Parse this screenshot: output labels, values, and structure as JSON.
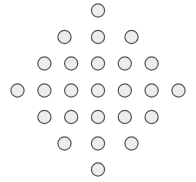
{
  "figure": {
    "name": "diamond-circle-lattice",
    "width": 196,
    "height": 182,
    "background_color": "#ffffff"
  },
  "style": {
    "node_fill": "#ededed",
    "node_stroke": "#555555",
    "node_stroke_width": 1.2,
    "node_radius": 6.6
  },
  "chart_data": {
    "type": "scatter",
    "title": "",
    "subtitle": "",
    "xlabel": "",
    "ylabel": "",
    "grid": false,
    "legend": null,
    "axis_visible": false,
    "tick_labels_x": [],
    "tick_labels_y": [],
    "xlim": [
      0,
      196
    ],
    "ylim": [
      0,
      182
    ],
    "marker": "circle",
    "marker_radius": 6.6,
    "marker_fill": "#ededed",
    "marker_stroke": "#555555",
    "point_count": 25,
    "shape": "diamond",
    "rows": [
      {
        "row_index": 0,
        "count": 1,
        "cy": 10.5,
        "cx": [
          98.0
        ]
      },
      {
        "row_index": 1,
        "count": 3,
        "cy": 37.0,
        "cx": [
          64.5,
          98.0,
          131.5
        ]
      },
      {
        "row_index": 2,
        "count": 5,
        "cy": 63.5,
        "cx": [
          44.4,
          71.2,
          98.0,
          124.8,
          151.6
        ]
      },
      {
        "row_index": 3,
        "count": 7,
        "cy": 90.5,
        "cx": [
          17.5,
          44.4,
          71.2,
          98.0,
          124.8,
          151.6,
          178.5
        ]
      },
      {
        "row_index": 4,
        "count": 5,
        "cy": 117.0,
        "cx": [
          44.4,
          71.2,
          98.0,
          124.8,
          151.6
        ]
      },
      {
        "row_index": 5,
        "count": 3,
        "cy": 143.5,
        "cx": [
          64.5,
          98.0,
          131.5
        ]
      },
      {
        "row_index": 6,
        "count": 1,
        "cy": 169.5,
        "cx": [
          98.0
        ]
      }
    ],
    "points": [
      {
        "x": 98.0,
        "y": 10.5
      },
      {
        "x": 64.5,
        "y": 37.0
      },
      {
        "x": 98.0,
        "y": 37.0
      },
      {
        "x": 131.5,
        "y": 37.0
      },
      {
        "x": 44.4,
        "y": 63.5
      },
      {
        "x": 71.2,
        "y": 63.5
      },
      {
        "x": 98.0,
        "y": 63.5
      },
      {
        "x": 124.8,
        "y": 63.5
      },
      {
        "x": 151.6,
        "y": 63.5
      },
      {
        "x": 17.5,
        "y": 90.5
      },
      {
        "x": 44.4,
        "y": 90.5
      },
      {
        "x": 71.2,
        "y": 90.5
      },
      {
        "x": 98.0,
        "y": 90.5
      },
      {
        "x": 124.8,
        "y": 90.5
      },
      {
        "x": 151.6,
        "y": 90.5
      },
      {
        "x": 178.5,
        "y": 90.5
      },
      {
        "x": 44.4,
        "y": 117.0
      },
      {
        "x": 71.2,
        "y": 117.0
      },
      {
        "x": 98.0,
        "y": 117.0
      },
      {
        "x": 124.8,
        "y": 117.0
      },
      {
        "x": 151.6,
        "y": 117.0
      },
      {
        "x": 64.5,
        "y": 143.5
      },
      {
        "x": 98.0,
        "y": 143.5
      },
      {
        "x": 131.5,
        "y": 143.5
      },
      {
        "x": 98.0,
        "y": 169.5
      }
    ],
    "row_counts": [
      1,
      3,
      5,
      7,
      5,
      3,
      1
    ]
  }
}
